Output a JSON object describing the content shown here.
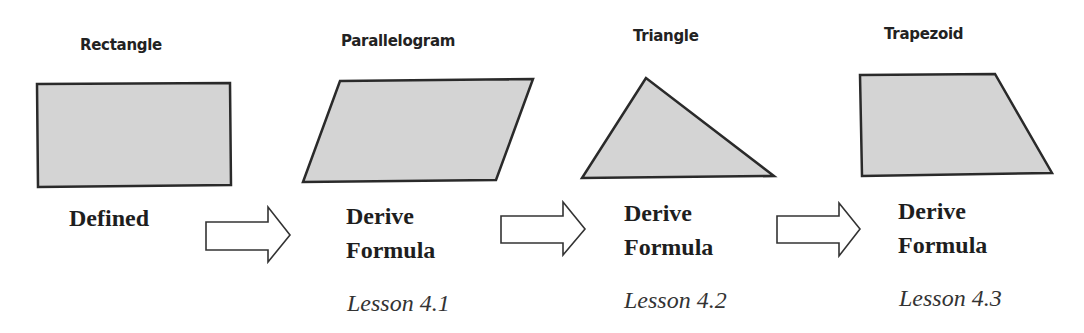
{
  "diagram": {
    "shapes": [
      {
        "name": "Rectangle",
        "status": "Defined",
        "lesson": ""
      },
      {
        "name": "Parallelogram",
        "status_line1": "Derive",
        "status_line2": "Formula",
        "lesson": "Lesson 4.1"
      },
      {
        "name": "Triangle",
        "status_line1": "Derive",
        "status_line2": "Formula",
        "lesson": "Lesson 4.2"
      },
      {
        "name": "Trapezoid",
        "status_line1": "Derive",
        "status_line2": "Formula",
        "lesson": "Lesson 4.3"
      }
    ],
    "arrows": [
      "right-arrow",
      "right-arrow",
      "right-arrow"
    ],
    "colors": {
      "shape_fill": "#d4d4d4",
      "shape_stroke": "#2a2a2a",
      "arrow_fill": "#ffffff"
    }
  }
}
